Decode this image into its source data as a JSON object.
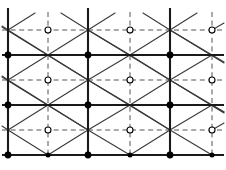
{
  "figure": {
    "type": "lattice-diagram",
    "width": 226,
    "height": 170,
    "background": "#ffffff"
  },
  "style": {
    "solid_color": "#1a1a1a",
    "dashed_color": "#4d4d4d",
    "diagonal_color": "#3a3a3a",
    "node_fill_color": "#000000",
    "node_open_fill": "#ffffff",
    "node_open_stroke": "#000000",
    "solid_width": 2.1,
    "dashed_width": 1.0,
    "diagonal_width": 1.1,
    "dash_pattern": "5,3.6",
    "node_filled_radius": 3.4,
    "node_small_radius": 2.5,
    "node_open_radius": 3.0
  },
  "geometry": {
    "solid_vertical_x": [
      8,
      88,
      170
    ],
    "dashed_vertical_x": [
      48,
      130,
      212
    ],
    "solid_horizontal_y": [
      55,
      105,
      155
    ],
    "dashed_horizontal_y": [
      30,
      80,
      130
    ],
    "vertical_top": 8,
    "vertical_bottom": 155,
    "horizontal_left": 2,
    "horizontal_right": 224,
    "dashed_vertical_top": 12,
    "dashed_vertical_bottom": 155,
    "cell_width": 82,
    "cell_half_width": 41,
    "cell_height": 50,
    "cell_half_height": 25
  },
  "chart_data": {
    "type": "scatter",
    "title": "",
    "xlabel": "",
    "ylabel": "",
    "grid": true,
    "legend": "none",
    "xlim": [
      0,
      226
    ],
    "ylim": [
      0,
      170
    ],
    "series": [
      {
        "name": "filled-nodes",
        "marker": "filled-circle",
        "points": [
          [
            8,
            55
          ],
          [
            88,
            55
          ],
          [
            170,
            55
          ],
          [
            8,
            105
          ],
          [
            88,
            105
          ],
          [
            170,
            105
          ],
          [
            8,
            155
          ],
          [
            88,
            155
          ],
          [
            170,
            155
          ]
        ]
      },
      {
        "name": "small-filled-nodes",
        "marker": "small-filled-circle",
        "points": [
          [
            48,
            155
          ],
          [
            130,
            155
          ],
          [
            212,
            155
          ]
        ]
      },
      {
        "name": "open-nodes",
        "marker": "open-circle",
        "points": [
          [
            48,
            30
          ],
          [
            130,
            30
          ],
          [
            212,
            30
          ],
          [
            48,
            80
          ],
          [
            130,
            80
          ],
          [
            212,
            80
          ],
          [
            48,
            130
          ],
          [
            130,
            130
          ],
          [
            212,
            130
          ]
        ]
      }
    ]
  }
}
